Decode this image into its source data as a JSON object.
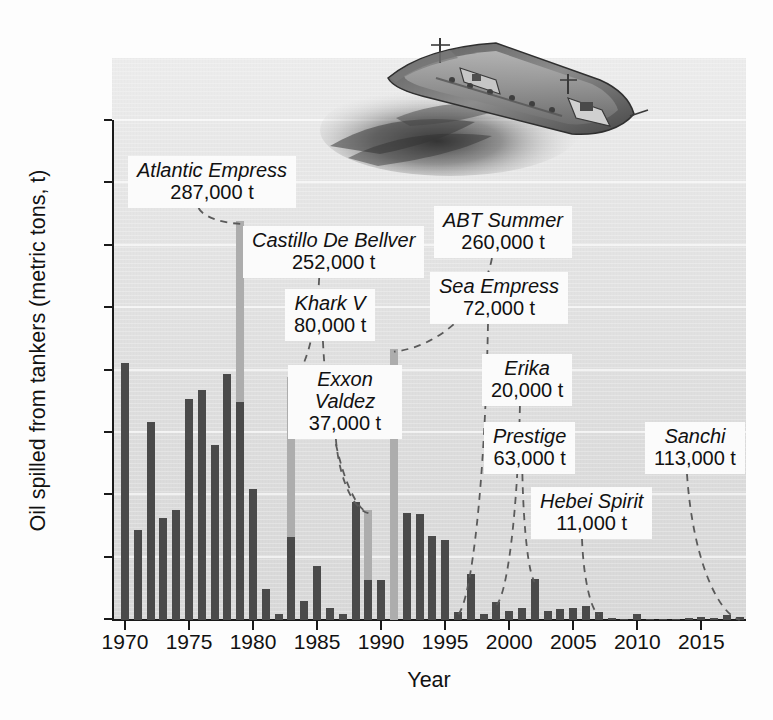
{
  "chart_data": {
    "type": "bar",
    "title": "",
    "xlabel": "Year",
    "ylabel": "Oil spilled from tankers (metric tons, t)",
    "ylim": [
      0,
      800
    ],
    "xlim": [
      1969.3,
      2018.8
    ],
    "yticks": [
      0,
      100,
      200,
      300,
      400,
      500,
      600,
      700,
      800
    ],
    "ytick_labels": [
      "0",
      "100",
      "200",
      "300",
      "400",
      "500",
      "600",
      "700",
      "800"
    ],
    "xticks": [
      1970,
      1975,
      1980,
      1985,
      1990,
      1995,
      2000,
      2005,
      2010,
      2015
    ],
    "xtick_labels": [
      "1970",
      "1975",
      "1980",
      "1985",
      "1990",
      "1995",
      "2000",
      "2005",
      "2010",
      "2015"
    ],
    "grid": "horizontal-light",
    "legend": "none",
    "units_note": "thousand tonnes",
    "bar_color": "#4a4a4a",
    "highlight_bar_color": "#adadad",
    "x": [
      1970,
      1971,
      1972,
      1973,
      1974,
      1975,
      1976,
      1977,
      1978,
      1979,
      1980,
      1981,
      1982,
      1983,
      1984,
      1985,
      1986,
      1987,
      1988,
      1989,
      1990,
      1991,
      1992,
      1993,
      1994,
      1995,
      1996,
      1997,
      1998,
      1999,
      2000,
      2001,
      2002,
      2003,
      2004,
      2005,
      2006,
      2007,
      2008,
      2009,
      2010,
      2011,
      2012,
      2013,
      2014,
      2015,
      2016,
      2017,
      2018
    ],
    "values": [
      412,
      145,
      318,
      163,
      177,
      355,
      368,
      280,
      395,
      640,
      210,
      50,
      9,
      390,
      31,
      86,
      19,
      9,
      190,
      176,
      64,
      435,
      172,
      170,
      135,
      128,
      13,
      73,
      9,
      29,
      14,
      19,
      66,
      15,
      17,
      20,
      22,
      13,
      3,
      2,
      10,
      2,
      1,
      2,
      3,
      5,
      4,
      8,
      5
    ],
    "highlighted_years": [
      1979,
      1983,
      1989,
      1991,
      1996,
      1999,
      2002,
      2007,
      2018
    ],
    "highlight_base_values": {
      "1979": 350,
      "1983": 133,
      "1989": 64,
      "1991": 0,
      "1996": 13,
      "1999": 29,
      "2002": 66,
      "2007": 13,
      "2018": 5
    },
    "annotations": [
      {
        "name": "Atlantic Empress",
        "amount": "287,000 t",
        "year": 1979,
        "label_left": 128,
        "label_top": 156
      },
      {
        "name": "Castillo De Bellver",
        "amount": "252,000 t",
        "year": 1983,
        "label_left": 243,
        "label_top": 226
      },
      {
        "name": "Khark V",
        "amount": "80,000 t",
        "year": 1989,
        "label_left": 285,
        "label_top": 289
      },
      {
        "name": "Exxon Valdez",
        "amount": "37,000 t",
        "year": 1989,
        "label_left": 288,
        "label_top": 365
      },
      {
        "name": "ABT Summer",
        "amount": "260,000 t",
        "year": 1991,
        "label_left": 434,
        "label_top": 206
      },
      {
        "name": "Sea Empress",
        "amount": "72,000 t",
        "year": 1996,
        "label_left": 430,
        "label_top": 272
      },
      {
        "name": "Erika",
        "amount": "20,000 t",
        "year": 1999,
        "label_left": 482,
        "label_top": 354
      },
      {
        "name": "Prestige",
        "amount": "63,000 t",
        "year": 2002,
        "label_left": 484,
        "label_top": 422
      },
      {
        "name": "Hebei Spirit",
        "amount": "11,000 t",
        "year": 2007,
        "label_left": 531,
        "label_top": 487
      },
      {
        "name": "Sanchi",
        "amount": "113,000 t",
        "year": 2018,
        "label_left": 645,
        "label_top": 422
      }
    ]
  },
  "figure": {
    "illustration_alt": "oil-tanker-with-slick-illustration",
    "background_color": "#e4e4e4",
    "axis_color": "#1a1a1a",
    "text_color": "#111111"
  }
}
